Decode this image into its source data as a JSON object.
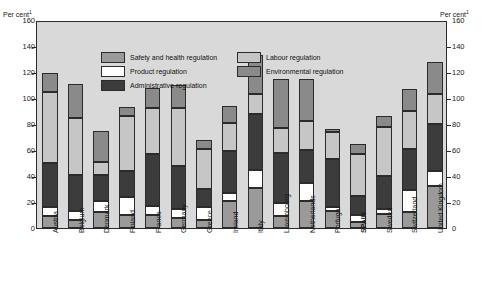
{
  "axes": {
    "unit_left": "Per cent",
    "unit_right": "Per cent",
    "unit_superscript": "1",
    "yticks": [
      "160",
      "140",
      "120",
      "100",
      "80",
      "60",
      "40",
      "20",
      "0"
    ]
  },
  "legend": {
    "items": [
      {
        "label": "Safety and health regulation",
        "key": "safety",
        "color": "#9a9a9a"
      },
      {
        "label": "Labour regulation",
        "key": "labour",
        "color": "#c6c6c6"
      },
      {
        "label": "Product regulation",
        "key": "product",
        "color": "#ffffff"
      },
      {
        "label": "Environmental regulation",
        "key": "environ",
        "color": "#8a8a8a"
      },
      {
        "label": "Administrative regulation",
        "key": "admin",
        "color": "#3c3c3c"
      }
    ]
  },
  "chart_data": {
    "type": "bar",
    "stacked": true,
    "title": "",
    "xlabel": "",
    "ylabel": "Per cent",
    "ylim": [
      0,
      160
    ],
    "ytick_step": 20,
    "grid": false,
    "legend_position": "inside-top-left",
    "categories": [
      "Austria",
      "Belgium",
      "Denmark",
      "Finland",
      "France",
      "Germany",
      "Greece",
      "Ireland",
      "Italy",
      "Luxembourg",
      "Netherlands",
      "Portugal",
      "SPAIN",
      "Sweden",
      "Switzerland",
      "United Kingdom"
    ],
    "highlighted_category": "SPAIN",
    "series": [
      {
        "name": "Safety and health regulation",
        "color": "#9a9a9a",
        "values": [
          9,
          6,
          12,
          10,
          10,
          8,
          6,
          21,
          31,
          9,
          21,
          13,
          5,
          11,
          12,
          32
        ]
      },
      {
        "name": "Product regulation",
        "color": "#ffffff",
        "values": [
          7,
          7,
          9,
          14,
          7,
          7,
          10,
          6,
          14,
          10,
          14,
          3,
          5,
          4,
          17,
          12
        ]
      },
      {
        "name": "Administrative regulation",
        "color": "#3c3c3c",
        "values": [
          34,
          28,
          20,
          20,
          40,
          33,
          14,
          32,
          43,
          39,
          25,
          37,
          15,
          25,
          32,
          36
        ]
      },
      {
        "name": "Labour regulation",
        "color": "#c6c6c6",
        "values": [
          55,
          44,
          10,
          42,
          35,
          44,
          31,
          22,
          15,
          19,
          22,
          21,
          32,
          38,
          29,
          23
        ]
      },
      {
        "name": "Environmental regulation",
        "color": "#8a8a8a",
        "values": [
          14,
          26,
          24,
          7,
          16,
          18,
          7,
          13,
          30,
          38,
          33,
          2,
          8,
          8,
          17,
          25
        ]
      }
    ],
    "totals": [
      119,
      111,
      75,
      93,
      108,
      110,
      68,
      94,
      133,
      115,
      115,
      76,
      65,
      86,
      107,
      128
    ]
  }
}
